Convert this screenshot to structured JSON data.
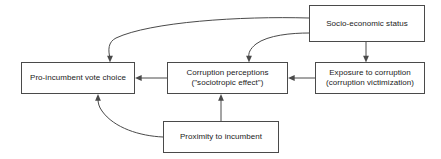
{
  "diagram": {
    "background_color": "#ffffff",
    "box_border_color": "#4a4a4a",
    "arrow_color": "#4a4a4a",
    "text_color": "#1a1a1a",
    "nodes": [
      {
        "id": "socio-economic-status",
        "label": "Socio-economic status",
        "x": 309,
        "y": 5,
        "width": 116,
        "height": 37
      },
      {
        "id": "exposure-to-corruption",
        "label": "Exposure to corruption\n(corruption victimization)",
        "x": 315,
        "y": 62,
        "width": 110,
        "height": 32
      },
      {
        "id": "corruption-perceptions",
        "label": "Corruption perceptions\n(\"sociotropic effect\")",
        "x": 167,
        "y": 62,
        "width": 121,
        "height": 32
      },
      {
        "id": "pro-incumbent-vote-choice",
        "label": "Pro-incumbent vote choice",
        "x": 21,
        "y": 62,
        "width": 114,
        "height": 32
      },
      {
        "id": "proximity-to-incumbent",
        "label": "Proximity to incumbent",
        "x": 163,
        "y": 121,
        "width": 116,
        "height": 32
      }
    ],
    "edges": [
      {
        "id": "ses-to-vote-choice",
        "from": "socio-economic-status",
        "to": "pro-incumbent-vote-choice",
        "style": "curved",
        "arrowhead": "down"
      },
      {
        "id": "ses-to-corruption-perceptions",
        "from": "socio-economic-status",
        "to": "corruption-perceptions",
        "style": "curved",
        "arrowhead": "down"
      },
      {
        "id": "ses-to-exposure",
        "from": "socio-economic-status",
        "to": "exposure-to-corruption",
        "style": "straight",
        "arrowhead": "down"
      },
      {
        "id": "exposure-to-corruption-perceptions",
        "from": "exposure-to-corruption",
        "to": "corruption-perceptions",
        "style": "straight",
        "arrowhead": "left"
      },
      {
        "id": "corruption-perceptions-to-vote-choice",
        "from": "corruption-perceptions",
        "to": "pro-incumbent-vote-choice",
        "style": "straight",
        "arrowhead": "left"
      },
      {
        "id": "proximity-to-corruption-perceptions",
        "from": "proximity-to-incumbent",
        "to": "corruption-perceptions",
        "style": "straight",
        "arrowhead": "up"
      },
      {
        "id": "proximity-to-vote-choice",
        "from": "proximity-to-incumbent",
        "to": "pro-incumbent-vote-choice",
        "style": "curved",
        "arrowhead": "up"
      }
    ]
  }
}
